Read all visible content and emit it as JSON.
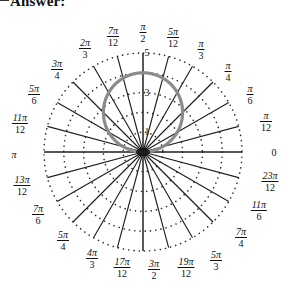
{
  "header": {
    "dash": "dash-mark",
    "title": "Answer:"
  },
  "plot": {
    "center_x": 143,
    "center_y": 152,
    "unit_px": 19.8,
    "rings": [
      1,
      2,
      3,
      4,
      5
    ],
    "spoke_count": 24,
    "grid_color": "#2b2b2b",
    "curve_color": "#8c8c8c",
    "axis_color": "#1f1f1f",
    "radial_labels": [
      {
        "text": "1",
        "r": 1
      },
      {
        "text": "3",
        "r": 3
      },
      {
        "text": "5",
        "r": 5
      }
    ],
    "angle_labels": [
      {
        "id": "theta-0",
        "num": "",
        "den": "",
        "plain": "0",
        "x": 274,
        "y": 152
      },
      {
        "id": "theta-pi-12",
        "num": "π",
        "den": "12",
        "plain": "",
        "x": 266,
        "y": 122
      },
      {
        "id": "theta-pi-6",
        "num": "π",
        "den": "6",
        "plain": "",
        "x": 250,
        "y": 95
      },
      {
        "id": "theta-pi-4",
        "num": "π",
        "den": "4",
        "plain": "",
        "x": 228,
        "y": 72
      },
      {
        "id": "theta-pi-3",
        "num": "π",
        "den": "3",
        "plain": "",
        "x": 201,
        "y": 50
      },
      {
        "id": "theta-5pi-12",
        "num": "5π",
        "den": "12",
        "plain": "",
        "x": 173,
        "y": 38
      },
      {
        "id": "theta-pi-2",
        "num": "π",
        "den": "2",
        "plain": "",
        "x": 143,
        "y": 33
      },
      {
        "id": "theta-7pi-12",
        "num": "7π",
        "den": "12",
        "plain": "",
        "x": 113,
        "y": 37
      },
      {
        "id": "theta-2pi-3",
        "num": "2π",
        "den": "3",
        "plain": "",
        "x": 85,
        "y": 49
      },
      {
        "id": "theta-3pi-4",
        "num": "3π",
        "den": "4",
        "plain": "",
        "x": 57,
        "y": 70
      },
      {
        "id": "theta-5pi-6",
        "num": "5π",
        "den": "6",
        "plain": "",
        "x": 34,
        "y": 95
      },
      {
        "id": "theta-11pi-12",
        "num": "11π",
        "den": "12",
        "plain": "",
        "x": 20,
        "y": 124
      },
      {
        "id": "theta-pi",
        "num": "",
        "den": "",
        "plain": "π",
        "x": 14,
        "y": 154
      },
      {
        "id": "theta-13pi-12",
        "num": "13π",
        "den": "12",
        "plain": "",
        "x": 22,
        "y": 186
      },
      {
        "id": "theta-7pi-6",
        "num": "7π",
        "den": "6",
        "plain": "",
        "x": 38,
        "y": 215
      },
      {
        "id": "theta-5pi-4",
        "num": "5π",
        "den": "4",
        "plain": "",
        "x": 63,
        "y": 241
      },
      {
        "id": "theta-4pi-3",
        "num": "4π",
        "den": "3",
        "plain": "",
        "x": 92,
        "y": 259
      },
      {
        "id": "theta-17pi-12",
        "num": "17π",
        "den": "12",
        "plain": "",
        "x": 122,
        "y": 268
      },
      {
        "id": "theta-3pi-2",
        "num": "3π",
        "den": "2",
        "plain": "",
        "x": 154,
        "y": 270
      },
      {
        "id": "theta-19pi-12",
        "num": "19π",
        "den": "12",
        "plain": "",
        "x": 186,
        "y": 268
      },
      {
        "id": "theta-5pi-3",
        "num": "5π",
        "den": "3",
        "plain": "",
        "x": 216,
        "y": 261
      },
      {
        "id": "theta-7pi-4",
        "num": "7π",
        "den": "4",
        "plain": "",
        "x": 241,
        "y": 238
      },
      {
        "id": "theta-11pi-6",
        "num": "11π",
        "den": "6",
        "plain": "",
        "x": 259,
        "y": 211
      },
      {
        "id": "theta-23pi-12",
        "num": "23π",
        "den": "12",
        "plain": "",
        "x": 270,
        "y": 182
      }
    ]
  },
  "chart_data": {
    "type": "line",
    "title": "",
    "coordinate_system": "polar",
    "curve_equation": "r = 4 sin(theta)",
    "curve_description": "circle of radius 2 centered at (0,2) in Cartesian, traced for theta from 0 to pi",
    "r_max": 5,
    "rlim": [
      0,
      5
    ],
    "r_ticks": [
      1,
      3,
      5
    ],
    "theta_ticks": [
      "0",
      "π/12",
      "π/6",
      "π/4",
      "π/3",
      "5π/12",
      "π/2",
      "7π/12",
      "2π/3",
      "3π/4",
      "5π/6",
      "11π/12",
      "π",
      "13π/12",
      "7π/6",
      "5π/4",
      "4π/3",
      "17π/12",
      "3π/2",
      "19π/12",
      "5π/3",
      "7π/4",
      "11π/6",
      "23π/12"
    ],
    "grid": true,
    "legend": "none",
    "series": [
      {
        "name": "r = 4 sin(theta)",
        "theta": [
          0,
          0.2618,
          0.5236,
          0.7854,
          1.0472,
          1.309,
          1.5708,
          1.8326,
          2.0944,
          2.3562,
          2.618,
          2.8798,
          3.1416
        ],
        "r": [
          0.0,
          1.04,
          2.0,
          2.83,
          3.46,
          3.86,
          4.0,
          3.86,
          3.46,
          2.83,
          2.0,
          1.04,
          0.0
        ]
      }
    ]
  }
}
